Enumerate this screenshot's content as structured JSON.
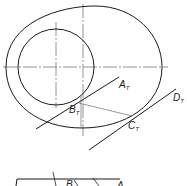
{
  "diagram": {
    "labels": {
      "a_t": "A",
      "a_t_sub": "T",
      "b_t": "B",
      "b_t_sub": "T",
      "c_t": "C",
      "c_t_sub": "T",
      "d_t": "D",
      "d_t_sub": "T",
      "bottom_b": "B",
      "bottom_a": "A"
    },
    "colors": {
      "stroke": "#1a1a1a",
      "centerline": "#888888",
      "background": "#ffffff"
    }
  }
}
